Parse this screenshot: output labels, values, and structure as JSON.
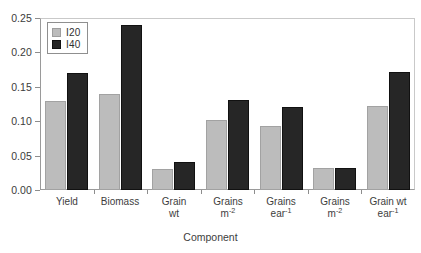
{
  "chart_data": {
    "type": "bar",
    "title": "",
    "xlabel": "Component",
    "ylabel": "",
    "ylim": [
      0.0,
      0.25
    ],
    "yticks": [
      "0.00",
      "0.05",
      "0.10",
      "0.15",
      "0.20",
      "0.25"
    ],
    "ytick_values": [
      0.0,
      0.05,
      0.1,
      0.15,
      0.2,
      0.25
    ],
    "grid": false,
    "legend_position": "top-left",
    "categories": [
      {
        "line1": "Yield",
        "line2": "",
        "sup": ""
      },
      {
        "line1": "Biomass",
        "line2": "",
        "sup": ""
      },
      {
        "line1": "Grain",
        "line2": "wt",
        "sup": ""
      },
      {
        "line1": "Grains",
        "line2": "m",
        "sup": "-2"
      },
      {
        "line1": "Grains",
        "line2": "ear",
        "sup": "-1"
      },
      {
        "line1": "Grains",
        "line2": "m",
        "sup": "-2"
      },
      {
        "line1": "Grain wt",
        "line2": "ear",
        "sup": "-1"
      }
    ],
    "series": [
      {
        "name": "I20",
        "color": "#bcbcbc",
        "values": [
          0.13,
          0.14,
          0.03,
          0.102,
          0.093,
          0.032,
          0.122
        ]
      },
      {
        "name": "I40",
        "color": "#262626",
        "values": [
          0.17,
          0.24,
          0.04,
          0.131,
          0.121,
          0.032,
          0.172
        ]
      }
    ]
  },
  "legend": {
    "entries": [
      {
        "label": "I20"
      },
      {
        "label": "I40"
      }
    ]
  },
  "axis": {
    "x_title": "Component"
  },
  "colors": {
    "i20": "#bcbcbc",
    "i40": "#262626",
    "axis": "#8d8d8d",
    "text": "#3d3d3d"
  }
}
